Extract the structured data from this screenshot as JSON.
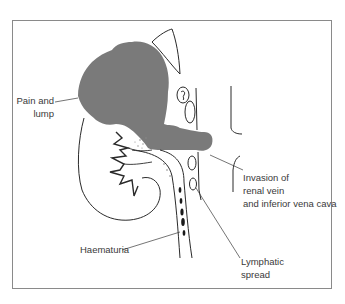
{
  "figure": {
    "type": "medical-diagram",
    "colors": {
      "tumour": "#7a7a7a",
      "line": "#2a2a2a",
      "frame": "#8a8a8a",
      "text": "#3a3a3a",
      "background": "#ffffff"
    }
  },
  "labels": {
    "pain_and_lump": {
      "line1": "Pain and",
      "line2": "lump"
    },
    "invasion": {
      "line1": "Invasion of",
      "line2": "renal vein",
      "line3": "and inferior vena cava"
    },
    "haematuria": {
      "line1": "Haematuria"
    },
    "lymphatic": {
      "line1": "Lymphatic",
      "line2": "spread"
    }
  }
}
